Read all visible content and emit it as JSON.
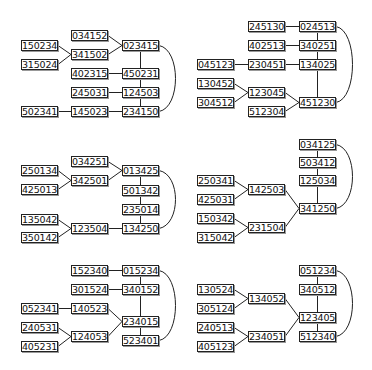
{
  "diagrams": [
    {
      "id": "panel-1",
      "nodes": [
        {
          "id": "034152",
          "label": "034152",
          "x": 71,
          "y": 30
        },
        {
          "id": "023415",
          "label": "023415",
          "x": 122,
          "y": 40
        },
        {
          "id": "150234",
          "label": "150234",
          "x": 21,
          "y": 40
        },
        {
          "id": "341502",
          "label": "341502",
          "x": 71,
          "y": 49
        },
        {
          "id": "315024",
          "label": "315024",
          "x": 21,
          "y": 59
        },
        {
          "id": "402315",
          "label": "402315",
          "x": 71,
          "y": 68
        },
        {
          "id": "450231",
          "label": "450231",
          "x": 122,
          "y": 68
        },
        {
          "id": "245031",
          "label": "245031",
          "x": 71,
          "y": 87
        },
        {
          "id": "124503",
          "label": "124503",
          "x": 122,
          "y": 87
        },
        {
          "id": "502341",
          "label": "502341",
          "x": 21,
          "y": 106
        },
        {
          "id": "145023",
          "label": "145023",
          "x": 71,
          "y": 106
        },
        {
          "id": "234150",
          "label": "234150",
          "x": 122,
          "y": 106
        }
      ],
      "edges": [
        [
          "034152",
          "023415"
        ],
        [
          "341502",
          "023415"
        ],
        [
          "150234",
          "341502"
        ],
        [
          "315024",
          "341502"
        ],
        [
          "023415",
          "450231"
        ],
        [
          "402315",
          "450231"
        ],
        [
          "450231",
          "124503"
        ],
        [
          "245031",
          "124503"
        ],
        [
          "124503",
          "234150"
        ],
        [
          "502341",
          "145023"
        ],
        [
          "145023",
          "234150"
        ]
      ],
      "arc": [
        "023415",
        "234150"
      ]
    },
    {
      "id": "panel-2",
      "nodes": [
        {
          "id": "245130",
          "label": "245130",
          "x": 248,
          "y": 21
        },
        {
          "id": "024513",
          "label": "024513",
          "x": 299,
          "y": 21
        },
        {
          "id": "402513",
          "label": "402513",
          "x": 248,
          "y": 40
        },
        {
          "id": "340251",
          "label": "340251",
          "x": 299,
          "y": 40
        },
        {
          "id": "045123",
          "label": "045123",
          "x": 197,
          "y": 59
        },
        {
          "id": "230451",
          "label": "230451",
          "x": 248,
          "y": 59
        },
        {
          "id": "134025",
          "label": "134025",
          "x": 299,
          "y": 59
        },
        {
          "id": "130452",
          "label": "130452",
          "x": 197,
          "y": 78
        },
        {
          "id": "123045",
          "label": "123045",
          "x": 248,
          "y": 87
        },
        {
          "id": "304512",
          "label": "304512",
          "x": 197,
          "y": 97
        },
        {
          "id": "451230",
          "label": "451230",
          "x": 299,
          "y": 97
        },
        {
          "id": "512304",
          "label": "512304",
          "x": 248,
          "y": 106
        }
      ],
      "edges": [
        [
          "245130",
          "024513"
        ],
        [
          "402513",
          "340251"
        ],
        [
          "045123",
          "230451"
        ],
        [
          "230451",
          "134025"
        ],
        [
          "024513",
          "340251"
        ],
        [
          "340251",
          "134025"
        ],
        [
          "134025",
          "451230"
        ],
        [
          "130452",
          "123045"
        ],
        [
          "304512",
          "123045"
        ],
        [
          "123045",
          "451230"
        ],
        [
          "512304",
          "451230"
        ]
      ],
      "arc": [
        "024513",
        "451230"
      ]
    },
    {
      "id": "panel-3",
      "nodes": [
        {
          "id": "034251",
          "label": "034251",
          "x": 71,
          "y": 156
        },
        {
          "id": "013425",
          "label": "013425",
          "x": 122,
          "y": 165
        },
        {
          "id": "250134",
          "label": "250134",
          "x": 21,
          "y": 165
        },
        {
          "id": "342501",
          "label": "342501",
          "x": 71,
          "y": 175
        },
        {
          "id": "425013",
          "label": "425013",
          "x": 21,
          "y": 184
        },
        {
          "id": "501342",
          "label": "501342",
          "x": 122,
          "y": 185
        },
        {
          "id": "235014",
          "label": "235014",
          "x": 122,
          "y": 204
        },
        {
          "id": "135042",
          "label": "135042",
          "x": 21,
          "y": 214
        },
        {
          "id": "123504",
          "label": "123504",
          "x": 71,
          "y": 223
        },
        {
          "id": "134250",
          "label": "134250",
          "x": 122,
          "y": 223
        },
        {
          "id": "350142",
          "label": "350142",
          "x": 21,
          "y": 232
        }
      ],
      "edges": [
        [
          "034251",
          "013425"
        ],
        [
          "342501",
          "013425"
        ],
        [
          "250134",
          "342501"
        ],
        [
          "425013",
          "342501"
        ],
        [
          "013425",
          "501342"
        ],
        [
          "501342",
          "235014"
        ],
        [
          "235014",
          "134250"
        ],
        [
          "135042",
          "123504"
        ],
        [
          "350142",
          "123504"
        ],
        [
          "123504",
          "134250"
        ]
      ],
      "arc": [
        "013425",
        "134250"
      ]
    },
    {
      "id": "panel-4",
      "nodes": [
        {
          "id": "034125",
          "label": "034125",
          "x": 299,
          "y": 139
        },
        {
          "id": "503412",
          "label": "503412",
          "x": 299,
          "y": 157
        },
        {
          "id": "125034",
          "label": "125034",
          "x": 299,
          "y": 175
        },
        {
          "id": "250341",
          "label": "250341",
          "x": 197,
          "y": 175
        },
        {
          "id": "142503",
          "label": "142503",
          "x": 248,
          "y": 184
        },
        {
          "id": "425031",
          "label": "425031",
          "x": 197,
          "y": 194
        },
        {
          "id": "341250",
          "label": "341250",
          "x": 299,
          "y": 203
        },
        {
          "id": "150342",
          "label": "150342",
          "x": 197,
          "y": 213
        },
        {
          "id": "231504",
          "label": "231504",
          "x": 248,
          "y": 222
        },
        {
          "id": "315042",
          "label": "315042",
          "x": 197,
          "y": 232
        }
      ],
      "edges": [
        [
          "034125",
          "503412"
        ],
        [
          "503412",
          "125034"
        ],
        [
          "125034",
          "341250"
        ],
        [
          "250341",
          "142503"
        ],
        [
          "425031",
          "142503"
        ],
        [
          "142503",
          "341250"
        ],
        [
          "150342",
          "231504"
        ],
        [
          "315042",
          "231504"
        ],
        [
          "231504",
          "341250"
        ]
      ],
      "arc": [
        "034125",
        "341250"
      ]
    },
    {
      "id": "panel-5",
      "nodes": [
        {
          "id": "152340",
          "label": "152340",
          "x": 71,
          "y": 265
        },
        {
          "id": "015234",
          "label": "015234",
          "x": 122,
          "y": 265
        },
        {
          "id": "301524",
          "label": "301524",
          "x": 71,
          "y": 284
        },
        {
          "id": "340152",
          "label": "340152",
          "x": 122,
          "y": 284
        },
        {
          "id": "052341",
          "label": "052341",
          "x": 21,
          "y": 303
        },
        {
          "id": "140523",
          "label": "140523",
          "x": 71,
          "y": 303
        },
        {
          "id": "234015",
          "label": "234015",
          "x": 122,
          "y": 316
        },
        {
          "id": "240531",
          "label": "240531",
          "x": 21,
          "y": 322
        },
        {
          "id": "124053",
          "label": "124053",
          "x": 71,
          "y": 331
        },
        {
          "id": "523401",
          "label": "523401",
          "x": 122,
          "y": 335
        },
        {
          "id": "405231",
          "label": "405231",
          "x": 21,
          "y": 341
        }
      ],
      "edges": [
        [
          "152340",
          "015234"
        ],
        [
          "301524",
          "340152"
        ],
        [
          "015234",
          "340152"
        ],
        [
          "340152",
          "234015"
        ],
        [
          "052341",
          "140523"
        ],
        [
          "140523",
          "234015"
        ],
        [
          "240531",
          "124053"
        ],
        [
          "405231",
          "124053"
        ],
        [
          "124053",
          "234015"
        ],
        [
          "234015",
          "523401"
        ]
      ],
      "arc": [
        "015234",
        "523401"
      ]
    },
    {
      "id": "panel-6",
      "nodes": [
        {
          "id": "051234",
          "label": "051234",
          "x": 299,
          "y": 265
        },
        {
          "id": "340512",
          "label": "340512",
          "x": 299,
          "y": 284
        },
        {
          "id": "130524",
          "label": "130524",
          "x": 197,
          "y": 284
        },
        {
          "id": "134052",
          "label": "134052",
          "x": 248,
          "y": 293
        },
        {
          "id": "305124",
          "label": "305124",
          "x": 197,
          "y": 303
        },
        {
          "id": "123405",
          "label": "123405",
          "x": 299,
          "y": 312
        },
        {
          "id": "240513",
          "label": "240513",
          "x": 197,
          "y": 322
        },
        {
          "id": "234051",
          "label": "234051",
          "x": 248,
          "y": 331
        },
        {
          "id": "512340",
          "label": "512340",
          "x": 299,
          "y": 331
        },
        {
          "id": "405123",
          "label": "405123",
          "x": 197,
          "y": 341
        }
      ],
      "edges": [
        [
          "051234",
          "340512"
        ],
        [
          "340512",
          "123405"
        ],
        [
          "123405",
          "512340"
        ],
        [
          "130524",
          "134052"
        ],
        [
          "305124",
          "134052"
        ],
        [
          "134052",
          "123405"
        ],
        [
          "240513",
          "234051"
        ],
        [
          "405123",
          "234051"
        ],
        [
          "234051",
          "123405"
        ]
      ],
      "arc": [
        "051234",
        "512340"
      ]
    }
  ],
  "style": {
    "stroke": "#222222",
    "box_border": "#222222",
    "background": "#ffffff"
  }
}
